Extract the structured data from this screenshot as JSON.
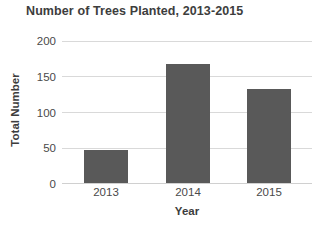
{
  "chart_data": {
    "type": "bar",
    "title": "Number of Trees Planted, 2013-2015",
    "xlabel": "Year",
    "ylabel": "Total Number",
    "categories": [
      "2013",
      "2014",
      "2015"
    ],
    "values": [
      47,
      167,
      133
    ],
    "ylim": [
      0,
      200
    ],
    "yticks": [
      0,
      50,
      100,
      150,
      200
    ],
    "ytick_labels": [
      "0",
      "50",
      "100",
      "150",
      "200"
    ],
    "grid": "horizontal",
    "legend": "none",
    "bar_color": "#595959",
    "gridline_color": "#d9d9d9",
    "text_color": "#3d3d3d",
    "tick_label_color": "#4a4a4a",
    "background_color": "#ffffff"
  }
}
